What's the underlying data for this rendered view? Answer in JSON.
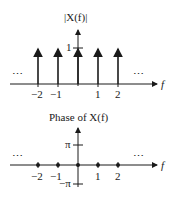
{
  "magnitude_plot": {
    "title": "|X(f)|",
    "y_tick_label": "1",
    "x_axis_label": "f",
    "x_tick_labels": [
      "−2",
      "−1",
      "1",
      "2"
    ],
    "ellipsis_left": "⋯",
    "ellipsis_right": "⋯",
    "impulses": [
      {
        "f": -2,
        "height": 1
      },
      {
        "f": -1,
        "height": 1
      },
      {
        "f": 0,
        "height": 1
      },
      {
        "f": 1,
        "height": 1
      },
      {
        "f": 2,
        "height": 1
      }
    ]
  },
  "phase_plot": {
    "title": "Phase of X(f)",
    "y_tick_top": "π",
    "y_tick_bottom": "−π",
    "x_axis_label": "f",
    "x_tick_labels": [
      "−2",
      "−1",
      "1",
      "2"
    ],
    "ellipsis_left": "⋯",
    "ellipsis_right": "⋯",
    "points": [
      {
        "f": -2,
        "phase": 0
      },
      {
        "f": -1,
        "phase": 0
      },
      {
        "f": 0,
        "phase": 0
      },
      {
        "f": 1,
        "phase": 0
      },
      {
        "f": 2,
        "phase": 0
      }
    ]
  }
}
